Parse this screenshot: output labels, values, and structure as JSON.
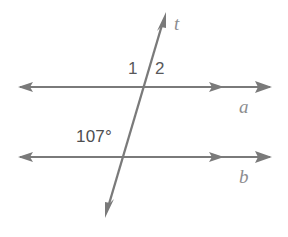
{
  "figure": {
    "background_color": "#ffffff",
    "line_color": "#7a7a7a",
    "number_color": "#58585a",
    "line_label_color": "#8d8d8f",
    "width": 288,
    "height": 237
  },
  "lines": {
    "a": {
      "name": "a",
      "y": 87,
      "x_start": 18,
      "x_end": 272,
      "left_arrow": "single",
      "right_arrow": "double"
    },
    "b": {
      "name": "b",
      "y": 157,
      "x_start": 18,
      "x_end": 272,
      "left_arrow": "single",
      "right_arrow": "double"
    },
    "t": {
      "name": "t",
      "x_top": 166,
      "y_top": 12,
      "x_bottom": 105,
      "y_bottom": 218,
      "top_arrow": "single",
      "bottom_arrow": "single"
    }
  },
  "intersections": {
    "with_a": {
      "x": 147,
      "y": 87
    },
    "with_b": {
      "x": 127,
      "y": 157
    }
  },
  "labels": {
    "angle_1": "1",
    "angle_2": "2",
    "angle_107": "107°",
    "line_t": "t",
    "line_a": "a",
    "line_b": "b"
  }
}
